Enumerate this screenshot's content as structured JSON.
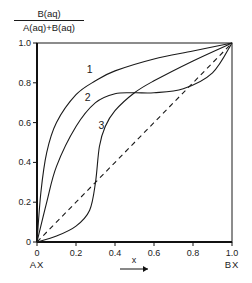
{
  "chart_data": {
    "type": "line",
    "title": "",
    "ylabel_numerator": "B(aq)",
    "ylabel_denominator": "A(aq)+B(aq)",
    "xlabel": "x",
    "x_end_labels": {
      "left": "AX",
      "right": "BX"
    },
    "xlim": [
      0,
      1.0
    ],
    "ylim": [
      0,
      1.0
    ],
    "x_ticks": [
      "0",
      "0.2",
      "0.4",
      "0.6",
      "0.8",
      "1.0"
    ],
    "y_ticks": [
      "0",
      "0.2",
      "0.4",
      "0.6",
      "0.8",
      "1.0"
    ],
    "grid": false,
    "legend": "inline curve labels 1, 2, 3",
    "series": [
      {
        "name": "1",
        "style": "solid",
        "x": [
          0,
          0.02,
          0.05,
          0.1,
          0.2,
          0.3,
          0.4,
          0.6,
          0.8,
          1.0
        ],
        "y": [
          0,
          0.25,
          0.45,
          0.6,
          0.74,
          0.81,
          0.86,
          0.92,
          0.96,
          1.0
        ]
      },
      {
        "name": "2",
        "style": "solid",
        "x": [
          0,
          0.05,
          0.1,
          0.2,
          0.3,
          0.4,
          0.5,
          0.6,
          0.75,
          0.9,
          1.0
        ],
        "y": [
          0,
          0.2,
          0.38,
          0.58,
          0.7,
          0.745,
          0.75,
          0.75,
          0.77,
          0.85,
          1.0
        ]
      },
      {
        "name": "3",
        "style": "solid",
        "x": [
          0,
          0.1,
          0.2,
          0.27,
          0.3,
          0.32,
          0.35,
          0.4,
          0.5,
          0.6,
          0.8,
          1.0
        ],
        "y": [
          0,
          0.03,
          0.08,
          0.16,
          0.3,
          0.48,
          0.58,
          0.66,
          0.75,
          0.81,
          0.91,
          1.0
        ]
      },
      {
        "name": "ideal",
        "style": "dashed",
        "x": [
          0,
          1.0
        ],
        "y": [
          0,
          1.0
        ]
      }
    ],
    "annotations": [
      {
        "text": "1",
        "x": 0.27,
        "y": 0.85
      },
      {
        "text": "2",
        "x": 0.26,
        "y": 0.71
      },
      {
        "text": "3",
        "x": 0.33,
        "y": 0.57
      }
    ]
  }
}
